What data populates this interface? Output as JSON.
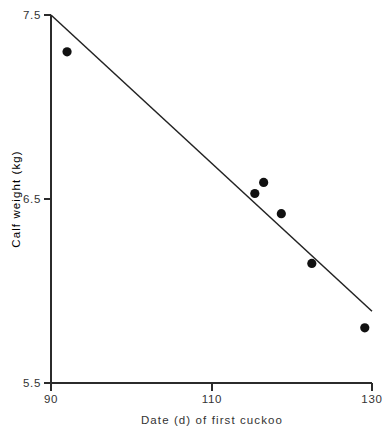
{
  "chart_data": {
    "type": "scatter",
    "title": "",
    "subtitle": "",
    "xlabel": "Date (d) of first cuckoo",
    "ylabel": "Calf weight (kg)",
    "xlim": [
      90,
      130
    ],
    "ylim": [
      5.5,
      7.5
    ],
    "xticks": [
      90,
      110,
      130
    ],
    "xtick_labels": [
      "90",
      "110",
      "130"
    ],
    "yticks": [
      5.5,
      6.5,
      7.5
    ],
    "ytick_labels": [
      "5.5",
      "6.5",
      "7.5"
    ],
    "grid": false,
    "legend": false,
    "legend_position": "none",
    "marker_color": "#111111",
    "line_color": "#222222",
    "axis_color": "#2b2b2b",
    "background_color": "#ffffff",
    "series": [
      {
        "name": "observations",
        "type": "scatter",
        "points": [
          {
            "x": 92.0,
            "y": 7.3
          },
          {
            "x": 115.4,
            "y": 6.53
          },
          {
            "x": 116.5,
            "y": 6.59
          },
          {
            "x": 118.7,
            "y": 6.42
          },
          {
            "x": 122.5,
            "y": 6.15
          },
          {
            "x": 129.1,
            "y": 5.8
          }
        ]
      },
      {
        "name": "regression-line",
        "type": "line",
        "points": [
          {
            "x": 90.0,
            "y": 7.5
          },
          {
            "x": 130.0,
            "y": 5.89
          }
        ]
      }
    ]
  },
  "axes": {
    "x_title": "Date (d) of first cuckoo",
    "y_title": "Calf weight (kg)",
    "x_tick_labels": [
      "90",
      "110",
      "130"
    ],
    "y_tick_labels": [
      "7.5",
      "6.5",
      "5.5"
    ]
  }
}
